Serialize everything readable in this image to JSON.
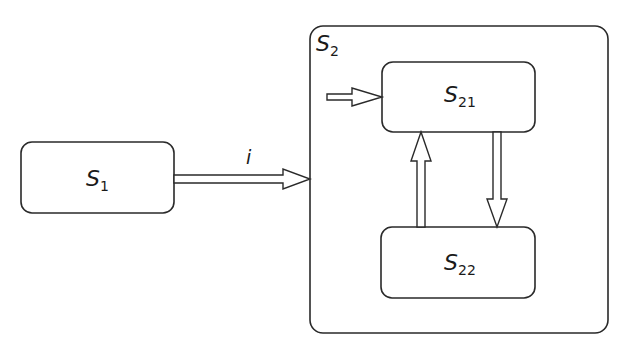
{
  "diagram": {
    "type": "statechart",
    "states": [
      {
        "id": "S1",
        "name": "S",
        "subscript": "1"
      },
      {
        "id": "S2",
        "name": "S",
        "subscript": "2",
        "children": [
          "S21",
          "S22"
        ]
      },
      {
        "id": "S21",
        "name": "S",
        "subscript": "21",
        "parent": "S2",
        "initial": true
      },
      {
        "id": "S22",
        "name": "S",
        "subscript": "22",
        "parent": "S2"
      }
    ],
    "transitions": [
      {
        "from": "S1",
        "to": "S2",
        "label": "i"
      },
      {
        "from": "S21",
        "to": "S22",
        "label": ""
      },
      {
        "from": "S22",
        "to": "S21",
        "label": ""
      },
      {
        "from": "initial",
        "to": "S21",
        "label": ""
      }
    ],
    "colors": {
      "stroke": "#2a2a2a",
      "fill": "#ffffff",
      "text": "#1a1a1a"
    }
  }
}
